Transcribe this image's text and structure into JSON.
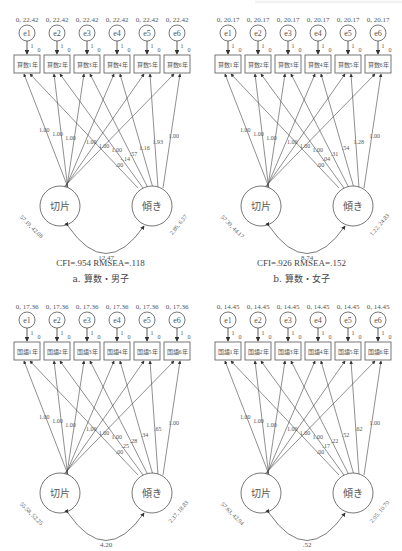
{
  "panels": [
    {
      "id": "a",
      "caption": "a. 算数・男子",
      "fit": "CFI=.954   RMSEA=.118",
      "error_label": "0, 22.42",
      "errors": [
        "e1",
        "e2",
        "e3",
        "e4",
        "e5",
        "e6"
      ],
      "indicators": [
        "算数1年",
        "算数2年",
        "算数3年",
        "算数4年",
        "算数5年",
        "算数6年"
      ],
      "error_path": "1",
      "intercept": "0",
      "intercept_loadings": [
        "1.00",
        "1.00",
        "1.00",
        "1.00",
        "1.00",
        "1.00"
      ],
      "slope_loadings": [
        ".00",
        "-.14",
        ".57",
        "1.16",
        "1.93",
        "1.00"
      ],
      "latent_intercept": {
        "label": "切片",
        "params": "57.19, 42.08"
      },
      "latent_slope": {
        "label": "傾き",
        "params": "2.86, 6.57"
      },
      "covariance": "12.47"
    },
    {
      "id": "b",
      "caption": "b. 算数・女子",
      "fit": "CFI=.926   RMSEA=.152",
      "error_label": "0, 20.17",
      "errors": [
        "e1",
        "e2",
        "e3",
        "e4",
        "e5",
        "e6"
      ],
      "indicators": [
        "算数1年",
        "算数2年",
        "算数3年",
        "算数4年",
        "算数5年",
        "算数6年"
      ],
      "error_path": "1",
      "intercept": "0",
      "intercept_loadings": [
        "1.00",
        "1.00",
        "1.00",
        "1.00",
        "1.00",
        "1.00"
      ],
      "slope_loadings": [
        ".00",
        ".04",
        ".31",
        ".54",
        "1.28",
        "1.00"
      ],
      "latent_intercept": {
        "label": "切片",
        "params": "57.39, 44.17"
      },
      "latent_slope": {
        "label": "傾き",
        "params": "1.22, 24.83"
      },
      "covariance": "8.74"
    },
    {
      "id": "c",
      "caption": "",
      "fit": "",
      "error_label": "0, 17.36",
      "errors": [
        "e1",
        "e2",
        "e3",
        "e4",
        "e5",
        "e6"
      ],
      "indicators": [
        "国語1年",
        "国語2年",
        "国語3年",
        "国語4年",
        "国語5年",
        "国語6年"
      ],
      "error_path": "1",
      "intercept": "0",
      "intercept_loadings": [
        "1.00",
        "1.00",
        "1.00",
        "1.00",
        "1.00",
        "1.00"
      ],
      "slope_loadings": [
        ".00",
        ".25",
        ".28",
        ".34",
        ".65",
        "1.00"
      ],
      "latent_intercept": {
        "label": "切片",
        "params": "55.58, 52.25"
      },
      "latent_slope": {
        "label": "傾き",
        "params": "2.37, 18.83"
      },
      "covariance": "4.20"
    },
    {
      "id": "d",
      "caption": "",
      "fit": "",
      "error_label": "0, 14.45",
      "errors": [
        "e1",
        "e2",
        "e3",
        "e4",
        "e5",
        "e6"
      ],
      "indicators": [
        "国語1年",
        "国語2年",
        "国語3年",
        "国語4年",
        "国語5年",
        "国語6年"
      ],
      "error_path": "1",
      "intercept": "0",
      "intercept_loadings": [
        "1.00",
        "1.00",
        "1.00",
        "1.00",
        "1.00",
        "1.00"
      ],
      "slope_loadings": [
        ".00",
        ".17",
        ".22",
        ".52",
        ".62",
        "1.00"
      ],
      "latent_intercept": {
        "label": "切片",
        "params": "57.63, 42.94"
      },
      "latent_slope": {
        "label": "傾き",
        "params": "2.05, 10.70"
      },
      "covariance": ".52"
    }
  ]
}
